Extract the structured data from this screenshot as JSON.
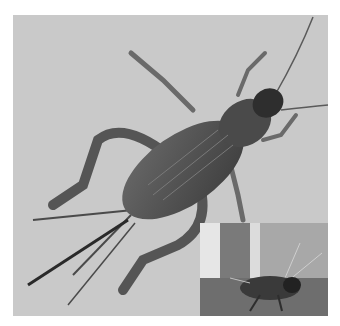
{
  "image": {
    "subject": "cricket",
    "description": "Grayscale photograph of a cricket viewed from above, with an inset photograph of a cricket in side view at lower right",
    "colors": {
      "background": "#c9c9c9",
      "body": "#5a5a5a",
      "body_dark": "#2e2e2e",
      "inset_background": "#9a9a9a"
    }
  },
  "main_photo": {
    "view": "dorsal",
    "label": "main-cricket-photo"
  },
  "inset_photo": {
    "view": "lateral",
    "label": "inset-cricket-photo"
  }
}
